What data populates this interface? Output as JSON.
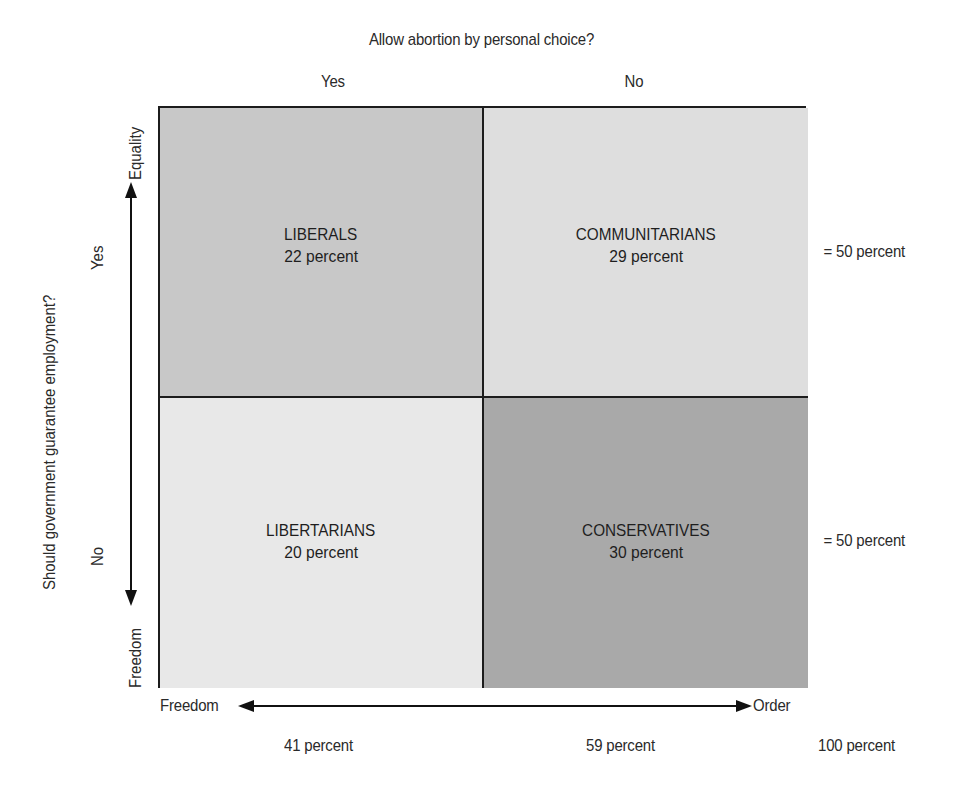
{
  "title": "Allow abortion by personal choice?",
  "columns": {
    "yes_label": "Yes",
    "no_label": "No"
  },
  "rows": {
    "question": "Should government guarantee employment?",
    "yes_label": "Yes",
    "no_label": "No"
  },
  "axes": {
    "vertical": {
      "top_label": "Equality",
      "bottom_label": "Freedom"
    },
    "horizontal": {
      "left_label": "Freedom",
      "right_label": "Order"
    }
  },
  "quadrants": {
    "top_left": {
      "name": "LIBERALS",
      "percent_text": "22 percent",
      "color": "#c8c8c8"
    },
    "top_right": {
      "name": "COMMUNITARIANS",
      "percent_text": "29 percent",
      "color": "#dedede"
    },
    "bottom_left": {
      "name": "LIBERTARIANS",
      "percent_text": "20 percent",
      "color": "#e8e8e8"
    },
    "bottom_right": {
      "name": "CONSERVATIVES",
      "percent_text": "30 percent",
      "color": "#a9a9a9"
    }
  },
  "row_totals": {
    "top": "= 50 percent",
    "bottom": "= 50 percent"
  },
  "column_totals": {
    "left": "41 percent",
    "right": "59 percent",
    "grand": "100 percent"
  },
  "colors": {
    "border": "#1c1c1c",
    "text": "#2a2a2a",
    "background": "#ffffff"
  }
}
